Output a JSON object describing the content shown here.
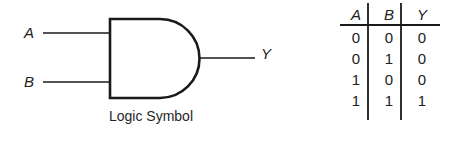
{
  "figure": {
    "caption": "Logic Symbol",
    "gate_type": "AND",
    "inputs": [
      {
        "label": "A"
      },
      {
        "label": "B"
      }
    ],
    "output": {
      "label": "Y"
    },
    "stroke_color": "#1a1a1a",
    "background_color": "#ffffff"
  },
  "truth_table": {
    "headers": [
      "A",
      "B",
      "Y"
    ],
    "rows": [
      [
        "0",
        "0",
        "0"
      ],
      [
        "0",
        "1",
        "0"
      ],
      [
        "1",
        "0",
        "0"
      ],
      [
        "1",
        "1",
        "1"
      ]
    ]
  }
}
